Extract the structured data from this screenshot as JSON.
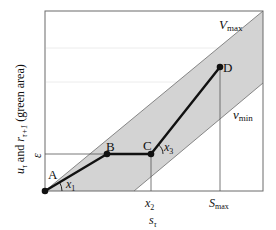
{
  "diagram": {
    "title": "",
    "y_axis_label": {
      "main": "u",
      "main_sub": "τ",
      "and": " and ",
      "r": "r",
      "r_sub": "τ+1",
      "suffix": " (green area)"
    },
    "x_axis_label": {
      "main": "s",
      "sub": "τ"
    },
    "y_tick": {
      "label": "ε"
    },
    "x_ticks": [
      {
        "main": "x",
        "sub": "2"
      },
      {
        "main": "S",
        "sub": "max"
      }
    ],
    "boundaries": {
      "upper": {
        "main": "V",
        "sub": "max"
      },
      "lower": {
        "main": "v",
        "sub": "min"
      }
    },
    "points": [
      {
        "name": "A",
        "label": "A",
        "x": 45,
        "y": 191
      },
      {
        "name": "B",
        "label": "B",
        "x": 107,
        "y": 154
      },
      {
        "name": "C",
        "label": "C",
        "x": 151,
        "y": 154
      },
      {
        "name": "D",
        "label": "D",
        "x": 220,
        "y": 67
      }
    ],
    "angles": [
      {
        "main": "x",
        "sub": "1"
      },
      {
        "main": "x",
        "sub": "3"
      }
    ],
    "colors": {
      "band_fill": "#d3d3d3",
      "band_edge": "#7a7a7a",
      "frame": "#6b6b6b",
      "path": "#111111",
      "guide": "#555555"
    }
  }
}
